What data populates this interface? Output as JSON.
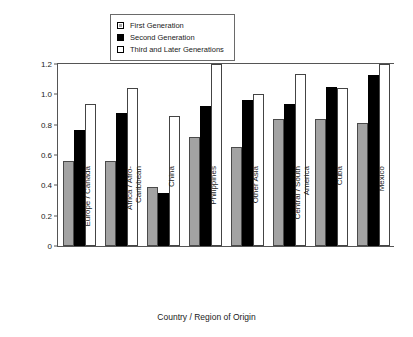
{
  "chart_data": {
    "type": "bar",
    "title": "",
    "xlabel": "Country / Region of Origin",
    "ylabel": "Health and School Porblems Index",
    "categories": [
      "Europe / Canada",
      "Africa / Afro-\nCaribbean",
      "China",
      "Philippines",
      "Other Asia",
      "Central / South\nAmerica",
      "Cuba",
      "Mexico"
    ],
    "series": [
      {
        "name": "First Generation",
        "color": "#a3a3a3",
        "values": [
          0.56,
          0.56,
          0.39,
          0.72,
          0.65,
          0.835,
          0.835,
          0.81
        ]
      },
      {
        "name": "Second Generation",
        "color": "#000000",
        "values": [
          0.765,
          0.88,
          0.35,
          0.92,
          0.965,
          0.935,
          1.05,
          1.125
        ]
      },
      {
        "name": "Third and Later Generations",
        "color": "#ffffff",
        "values": [
          0.935,
          1.045,
          0.86,
          1.26,
          1.005,
          1.135,
          1.045,
          1.235
        ]
      }
    ],
    "ylim": [
      0,
      1.2
    ],
    "yticks": [
      "0",
      "0.2",
      "0.4",
      "0.6",
      "0.8",
      "1.0",
      "1.2"
    ],
    "ytick_values": [
      0,
      0.2,
      0.4,
      0.6,
      0.8,
      1.0,
      1.2
    ],
    "grid": false,
    "legend_position": "top-center"
  },
  "legend": {
    "items": [
      {
        "label": "First Generation",
        "swatch": "gray-square-icon"
      },
      {
        "label": "Second Generation",
        "swatch": "black-square-icon"
      },
      {
        "label": "Third and Later Generations",
        "swatch": "white-square-icon"
      }
    ]
  }
}
